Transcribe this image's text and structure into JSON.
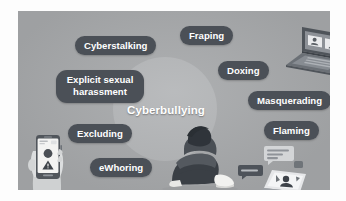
{
  "diagram": {
    "title": "Cyberbullying",
    "type": "concept-cluster",
    "center_label": "Cyberbullying",
    "background_color": "#a8aaac",
    "hub_circle_color": "#b4b6b8",
    "pill_color": "#4b5057",
    "pill_text_color": "#ffffff",
    "accent_dark": "#3a3f45",
    "nodes": [
      {
        "id": "cyberstalking",
        "label": "Cyberstalking"
      },
      {
        "id": "fraping",
        "label": "Fraping"
      },
      {
        "id": "doxing",
        "label": "Doxing"
      },
      {
        "id": "explicit-sexual-harassment",
        "label": "Explicit sexual harassment"
      },
      {
        "id": "masquerading",
        "label": "Masquerading"
      },
      {
        "id": "excluding",
        "label": "Excluding"
      },
      {
        "id": "flaming",
        "label": "Flaming"
      },
      {
        "id": "ewhoring",
        "label": "eWhoring"
      }
    ],
    "illustrations": [
      {
        "id": "laptop-video-call",
        "name": "laptop-with-video-call-icon"
      },
      {
        "id": "hand-phone-warning",
        "name": "hand-holding-smartphone-warning"
      },
      {
        "id": "seated-person",
        "name": "person-sitting-head-down"
      },
      {
        "id": "laptop-chat",
        "name": "laptop-with-chat-bubbles"
      }
    ]
  }
}
